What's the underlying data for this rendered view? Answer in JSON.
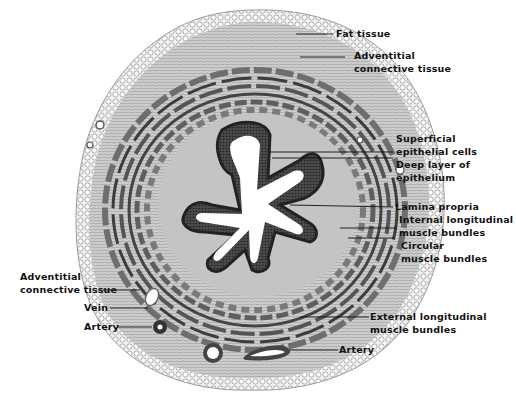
{
  "figure": {
    "colors": {
      "background": "#ffffff",
      "tissue_light": "#d8d8d8",
      "tissue_mid": "#9a9a9a",
      "tissue_dark": "#3a3a3a",
      "lumen": "#ffffff",
      "text": "#111111"
    }
  },
  "labels": {
    "fat_tissue": "Fat tissue",
    "adventitial_right_1": "Adventitial",
    "adventitial_right_2": "connective tissue",
    "superficial_1": "Superficial",
    "superficial_2": "epithelial cells",
    "deep_1": "Deep layer of",
    "deep_2": "epithelium",
    "lamina_propria": "Lamina propria",
    "internal_1": "Internal longitudinal",
    "internal_2": "muscle bundles",
    "circular_1": "Circular",
    "circular_2": "muscle bundles",
    "adventitial_left_1": "Adventitial",
    "adventitial_left_2": "connective tissue",
    "vein": "Vein",
    "artery_left": "Artery",
    "external_1": "External longitudinal",
    "external_2": "muscle bundles",
    "artery_bottom": "Artery"
  }
}
